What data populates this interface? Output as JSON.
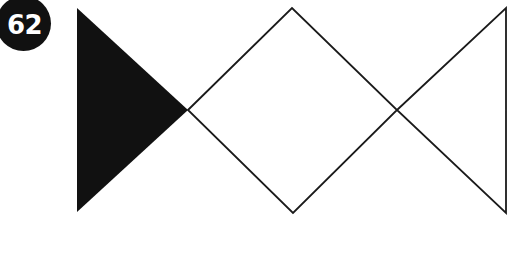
{
  "figure": {
    "number_label": "62",
    "background_color": "#ffffff",
    "stroke_color": "#1a1a1a",
    "fill_color": "#111111",
    "badge": {
      "shape": "circle",
      "fill": "#111111",
      "text_color": "#ffffff",
      "center_x": 23,
      "center_y": 23,
      "radius": 27
    },
    "canvas": {
      "width": 511,
      "height": 256
    },
    "shapes": [
      {
        "name": "filled-triangle-left",
        "type": "triangle",
        "fill": "#111111",
        "stroke": "none",
        "orientation": "points-right",
        "points": "77,8 77,212 188,110"
      },
      {
        "name": "diamond-center",
        "type": "quadrilateral",
        "fill": "none",
        "stroke": "#1a1a1a",
        "stroke_width": 1.8,
        "orientation": "square-rotated-45",
        "points": "188,110 292,8 397,110 293,213"
      },
      {
        "name": "outlined-triangle-right",
        "type": "triangle",
        "fill": "none",
        "stroke": "#1a1a1a",
        "stroke_width": 1.8,
        "orientation": "points-left",
        "points": "397,110 506,8 506,213"
      }
    ]
  }
}
